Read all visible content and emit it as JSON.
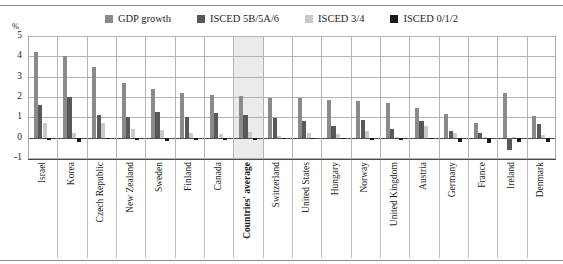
{
  "chart_data": {
    "type": "bar",
    "title": "",
    "subtitle": "",
    "xlabel": "",
    "ylabel": "%",
    "ylim": [
      -1,
      5
    ],
    "yticks": [
      5,
      4,
      3,
      2,
      1,
      0,
      -1
    ],
    "ytick_labels": [
      "5",
      "4",
      "3",
      "2",
      "1",
      "0",
      "-1"
    ],
    "grid": true,
    "legend_position": "top-center",
    "highlight_category": "Countries' average",
    "categories": [
      "Israel",
      "Korea",
      "Czech Republic",
      "New Zealand",
      "Sweden",
      "Finland",
      "Canada",
      "Countries' average",
      "Switzerland",
      "United States",
      "Hungary",
      "Norway",
      "United Kingdom",
      "Austria",
      "Germany",
      "France",
      "Ireland",
      "Denmark"
    ],
    "series": [
      {
        "name": "GDP growth",
        "color": "#8a8a8a",
        "values": [
          4.2,
          4.0,
          3.5,
          2.7,
          2.4,
          2.2,
          2.1,
          2.05,
          1.95,
          1.95,
          1.85,
          1.8,
          1.7,
          1.45,
          1.15,
          0.7,
          2.2,
          1.05
        ]
      },
      {
        "name": "ISCED 5B/5A/6",
        "color": "#59595b",
        "values": [
          1.6,
          2.0,
          1.1,
          1.0,
          1.25,
          1.0,
          1.2,
          1.1,
          0.95,
          0.8,
          0.55,
          0.85,
          0.45,
          0.8,
          0.35,
          0.25,
          -0.6,
          0.65
        ]
      },
      {
        "name": "ISCED 3/4",
        "color": "#c9c9c9",
        "values": [
          0.7,
          0.25,
          0.7,
          0.45,
          0.4,
          0.25,
          0.2,
          0.3,
          0.1,
          0.25,
          0.2,
          0.35,
          0.05,
          0.55,
          0.25,
          0.05,
          0.05,
          0.15
        ]
      },
      {
        "name": "ISCED 0/1/2",
        "color": "#1a1a1a",
        "values": [
          -0.1,
          -0.2,
          -0.05,
          -0.1,
          -0.15,
          -0.1,
          -0.1,
          -0.12,
          -0.08,
          -0.08,
          -0.05,
          -0.1,
          -0.1,
          -0.05,
          -0.2,
          -0.25,
          -0.2,
          -0.22
        ]
      }
    ]
  },
  "legend": {
    "items": [
      {
        "label": "GDP growth",
        "color": "#8a8a8a"
      },
      {
        "label": "ISCED 5B/5A/6",
        "color": "#59595b"
      },
      {
        "label": "ISCED 3/4",
        "color": "#c9c9c9"
      },
      {
        "label": "ISCED 0/1/2",
        "color": "#1a1a1a"
      }
    ]
  },
  "axis": {
    "unit_label": "%"
  }
}
